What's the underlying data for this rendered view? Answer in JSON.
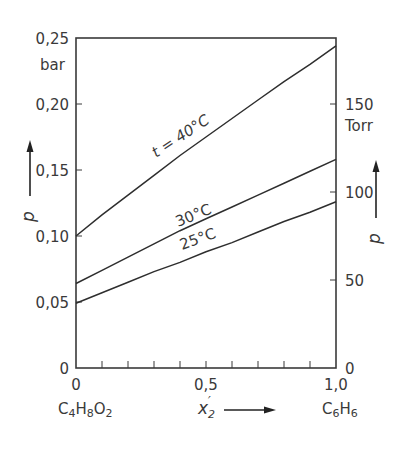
{
  "chart_data": {
    "type": "line",
    "title": "",
    "xlabel": "x2'",
    "xlabel_left_compound": {
      "base": "C",
      "parts": [
        [
          "C",
          ""
        ],
        [
          "H",
          "4"
        ],
        [
          "O",
          "8"
        ]
      ],
      "text": "C4H8O2"
    },
    "xlabel_right_compound": {
      "text": "C6H6"
    },
    "ylabel_left": "p",
    "ylabel_left_unit": "bar",
    "ylabel_right": "p",
    "ylabel_right_unit": "Torr",
    "xlim": [
      0,
      1.0
    ],
    "ylim_left": [
      0,
      0.25
    ],
    "ylim_right_torr": [
      0,
      187.5
    ],
    "x_ticks": [
      0,
      0.1,
      0.2,
      0.3,
      0.4,
      0.5,
      0.6,
      0.7,
      0.8,
      0.9,
      1.0
    ],
    "x_tick_labels": [
      "0",
      "0,5",
      "1,0"
    ],
    "y_left_ticks": [
      0,
      0.05,
      0.1,
      0.15,
      0.2,
      0.25
    ],
    "y_left_tick_labels": [
      "0",
      "0,05",
      "0,10",
      "0,15",
      "0,20",
      "0,25"
    ],
    "y_right_ticks_torr": [
      0,
      50,
      100,
      150
    ],
    "y_right_tick_labels": [
      "0",
      "50",
      "100",
      "150"
    ],
    "grid": false,
    "series": [
      {
        "name": "t = 40°C",
        "x": [
          0,
          0.1,
          0.2,
          0.3,
          0.4,
          0.5,
          0.6,
          0.7,
          0.8,
          0.9,
          1.0
        ],
        "values": [
          0.1,
          0.116,
          0.131,
          0.146,
          0.161,
          0.175,
          0.189,
          0.203,
          0.217,
          0.23,
          0.244
        ]
      },
      {
        "name": "30°C",
        "x": [
          0,
          0.1,
          0.2,
          0.3,
          0.4,
          0.5,
          0.6,
          0.7,
          0.8,
          0.9,
          1.0
        ],
        "values": [
          0.064,
          0.074,
          0.084,
          0.094,
          0.104,
          0.113,
          0.122,
          0.131,
          0.14,
          0.149,
          0.158
        ]
      },
      {
        "name": "25°C",
        "x": [
          0,
          0.1,
          0.2,
          0.3,
          0.4,
          0.5,
          0.6,
          0.7,
          0.8,
          0.9,
          1.0
        ],
        "values": [
          0.049,
          0.057,
          0.065,
          0.073,
          0.08,
          0.088,
          0.095,
          0.103,
          0.111,
          0.118,
          0.126
        ]
      }
    ],
    "annotations": [
      "t = 40°C",
      "30°C",
      "25°C"
    ],
    "legend": "none (inline curve labels)"
  },
  "labels": {
    "unit_left": "bar",
    "unit_right": "Torr",
    "p_left": "p",
    "p_right": "p",
    "x_var": "x",
    "x_sub": "2",
    "x_prime": "′",
    "left_compound": [
      "C",
      "4",
      "H",
      "8",
      "O",
      "2"
    ],
    "right_compound": [
      "C",
      "6",
      "H",
      "6"
    ],
    "curve_40": "t = 40°C",
    "curve_30": "30°C",
    "curve_25": "25°C"
  },
  "colors": {
    "ink": "#3a3a3a",
    "background": "#ffffff"
  }
}
